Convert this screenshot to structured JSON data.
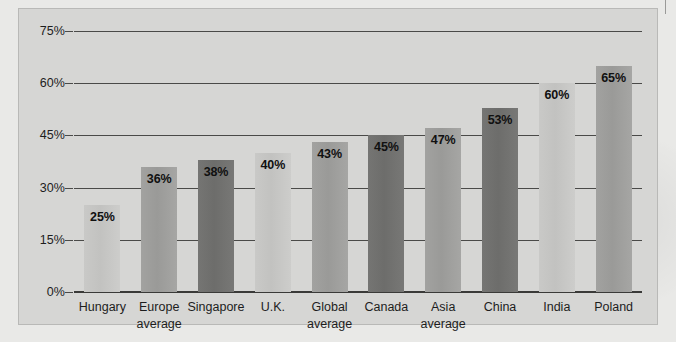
{
  "chart_data": {
    "type": "bar",
    "title": "",
    "subtitle": "",
    "xlabel": "",
    "ylabel": "",
    "ylim": [
      0,
      75
    ],
    "yticks": [
      "0%",
      "15%",
      "30%",
      "45%",
      "60%",
      "75%"
    ],
    "ytick_values": [
      0,
      15,
      30,
      45,
      60,
      75
    ],
    "grid": true,
    "legend": "none",
    "categories": [
      "Hungary",
      "Europe average",
      "Singapore",
      "U.K.",
      "Global average",
      "Canada",
      "Asia average",
      "China",
      "India",
      "Poland"
    ],
    "values": [
      25,
      36,
      38,
      40,
      43,
      45,
      47,
      53,
      60,
      65
    ],
    "value_labels": [
      "25%",
      "36%",
      "38%",
      "40%",
      "43%",
      "45%",
      "47%",
      "53%",
      "60%",
      "65%"
    ],
    "bars": [
      {
        "label_lines": [
          "Hungary"
        ],
        "value": 25,
        "value_label": "25%",
        "shade": "light"
      },
      {
        "label_lines": [
          "Europe",
          "average"
        ],
        "value": 36,
        "value_label": "36%",
        "shade": "medium"
      },
      {
        "label_lines": [
          "Singapore"
        ],
        "value": 38,
        "value_label": "38%",
        "shade": "dark"
      },
      {
        "label_lines": [
          "U.K."
        ],
        "value": 40,
        "value_label": "40%",
        "shade": "light"
      },
      {
        "label_lines": [
          "Global",
          "average"
        ],
        "value": 43,
        "value_label": "43%",
        "shade": "medium"
      },
      {
        "label_lines": [
          "Canada"
        ],
        "value": 45,
        "value_label": "45%",
        "shade": "dark"
      },
      {
        "label_lines": [
          "Asia",
          "average"
        ],
        "value": 47,
        "value_label": "47%",
        "shade": "medium"
      },
      {
        "label_lines": [
          "China"
        ],
        "value": 53,
        "value_label": "53%",
        "shade": "dark"
      },
      {
        "label_lines": [
          "India"
        ],
        "value": 60,
        "value_label": "60%",
        "shade": "light"
      },
      {
        "label_lines": [
          "Poland"
        ],
        "value": 65,
        "value_label": "65%",
        "shade": "medium"
      }
    ],
    "colors": {
      "panel_background": "#d6d6d4",
      "page_background": "#e9e9e7",
      "axis_line": "#3a3a38",
      "gridline": "#4a4a48",
      "bar_light": "#c9c9c7",
      "bar_medium": "#9e9e9c",
      "bar_dark": "#717170",
      "text": "#1d1d1d"
    }
  }
}
